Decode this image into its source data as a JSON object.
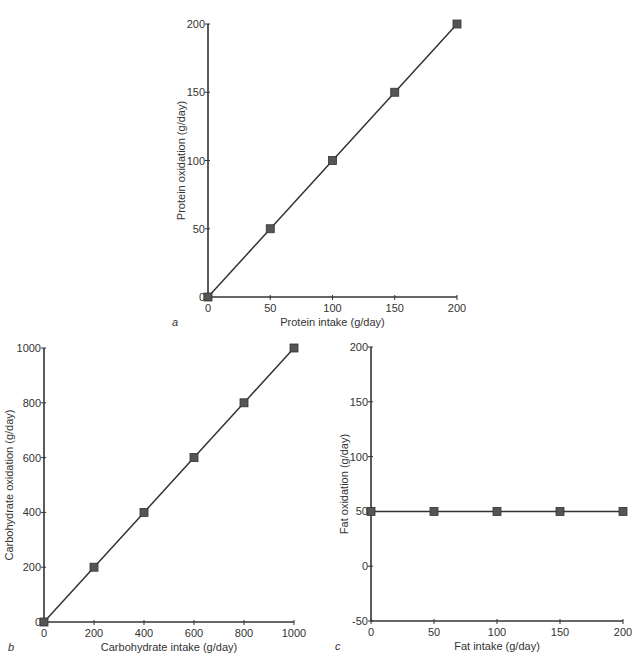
{
  "chart_data": [
    {
      "id": "a",
      "panel_label": "a",
      "type": "line",
      "title": "",
      "xlabel": "Protein intake (g/day)",
      "ylabel": "Protein oxidation (g/day)",
      "x": [
        0,
        50,
        100,
        150,
        200
      ],
      "series": [
        {
          "name": "Protein",
          "values": [
            0,
            50,
            100,
            150,
            200
          ]
        }
      ],
      "xlim": [
        0,
        200
      ],
      "ylim": [
        0,
        200
      ],
      "xticks": [
        0,
        50,
        100,
        150,
        200
      ],
      "yticks": [
        0,
        50,
        100,
        150,
        200
      ],
      "marker": "square",
      "grid": false,
      "legend": "none",
      "frame": {
        "x0": 208,
        "x1": 457,
        "y0": 297,
        "y1": 24
      }
    },
    {
      "id": "b",
      "panel_label": "b",
      "type": "line",
      "title": "",
      "xlabel": "Carbohydrate intake (g/day)",
      "ylabel": "Carbohydrate oxidation (g/day)",
      "x": [
        0,
        200,
        400,
        600,
        800,
        1000
      ],
      "series": [
        {
          "name": "Carbohydrate",
          "values": [
            0,
            200,
            400,
            600,
            800,
            1000
          ]
        }
      ],
      "xlim": [
        0,
        1000
      ],
      "ylim": [
        0,
        1000
      ],
      "xticks": [
        0,
        200,
        400,
        600,
        800,
        1000
      ],
      "yticks": [
        0,
        200,
        400,
        600,
        800,
        1000
      ],
      "marker": "square",
      "grid": false,
      "legend": "none",
      "frame": {
        "x0": 44,
        "x1": 294,
        "y0": 622,
        "y1": 348
      }
    },
    {
      "id": "c",
      "panel_label": "c",
      "type": "line",
      "title": "",
      "xlabel": "Fat intake (g/day)",
      "ylabel": "Fat oxidation (g/day)",
      "x": [
        0,
        50,
        100,
        150,
        200
      ],
      "series": [
        {
          "name": "Fat",
          "values": [
            50,
            50,
            50,
            50,
            50
          ]
        }
      ],
      "xlim": [
        0,
        200
      ],
      "ylim": [
        -50,
        200
      ],
      "xticks": [
        0,
        50,
        100,
        150,
        200
      ],
      "yticks": [
        -50,
        0,
        50,
        100,
        150,
        200
      ],
      "marker": "square",
      "grid": false,
      "legend": "none",
      "frame": {
        "x0": 371,
        "x1": 623,
        "y0": 621,
        "y1": 347
      }
    }
  ],
  "colors": {
    "axis": "#333333",
    "line": "#333333",
    "marker": "#555555"
  }
}
